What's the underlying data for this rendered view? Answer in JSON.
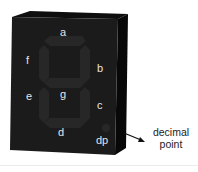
{
  "diagram": {
    "segments": [
      {
        "id": "a",
        "label": "a"
      },
      {
        "id": "b",
        "label": "b"
      },
      {
        "id": "c",
        "label": "c"
      },
      {
        "id": "d",
        "label": "d"
      },
      {
        "id": "e",
        "label": "e"
      },
      {
        "id": "f",
        "label": "f"
      },
      {
        "id": "g",
        "label": "g"
      },
      {
        "id": "dp",
        "label": "dp"
      }
    ],
    "callout": {
      "line1": "decimal",
      "line2": "point"
    },
    "colors": {
      "body": "#1a1a1a",
      "side": "#0b0b0b",
      "segment": "#2c2c2c",
      "label": "#e6e6e6"
    }
  }
}
